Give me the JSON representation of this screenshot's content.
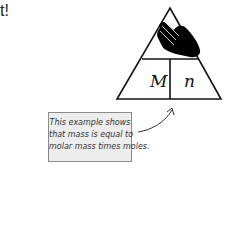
{
  "heading_fragment": "t!",
  "triangle": {
    "top_icon": "hand-covering-icon",
    "bottom_left": "M",
    "bottom_right": "n"
  },
  "annotation": {
    "lines": [
      "This example shows",
      "that mass is equal to",
      "molar mass times moles."
    ]
  }
}
